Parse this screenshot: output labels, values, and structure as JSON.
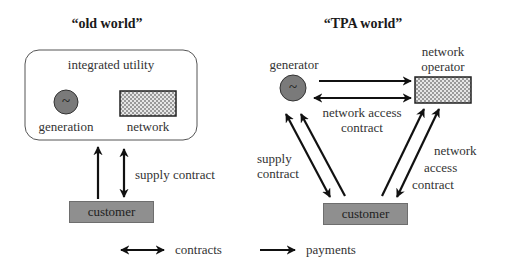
{
  "old_world": {
    "title": "“old world”",
    "utility_label": "integrated utility",
    "generation_label": "generation",
    "network_label": "network",
    "customer_label": "customer",
    "supply_contract_label": "supply contract",
    "generator_symbol": "~"
  },
  "tpa_world": {
    "title": "“TPA world”",
    "generator_label": "generator",
    "network_operator_label_line1": "network",
    "network_operator_label_line2": "operator",
    "network_access_contract_line1": "network access",
    "network_access_contract_line2": "contract",
    "supply_contract_line1": "supply",
    "supply_contract_line2": "contract",
    "right_contract_line1": "network",
    "right_contract_line2": "access",
    "right_contract_line3": "contract",
    "customer_label": "customer",
    "generator_symbol": "~"
  },
  "legend": {
    "contracts_label": "contracts",
    "payments_label": "payments"
  },
  "colors": {
    "generator_fill": "#7a7a7a",
    "customer_fill": "#8f8f8f",
    "arrow": "#111111"
  }
}
